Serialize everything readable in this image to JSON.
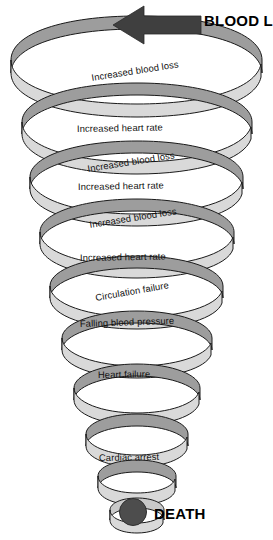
{
  "diagram": {
    "type": "descending-spiral-flow",
    "colors": {
      "background": "#ffffff",
      "ribbon_front": "#d9d9d9",
      "ribbon_back": "#9d9d9d",
      "ribbon_outline": "#1a1a1a",
      "arrow": "#3f3f3f",
      "death_marker": "#4d4d4d",
      "label_text": "#111111"
    },
    "entry": {
      "label": "BLOOD LOSS",
      "icon": "left-arrow-icon",
      "arrow_direction": "left"
    },
    "exit": {
      "label": "DEATH",
      "marker": "filled-circle-marker"
    },
    "coils": [
      {
        "id": 1,
        "label": "Increased blood loss",
        "shaded": true
      },
      {
        "id": 2,
        "label": "Increased heart rate",
        "shaded": false
      },
      {
        "id": 3,
        "label": "Increased blood loss",
        "shaded": true
      },
      {
        "id": 4,
        "label": "Increased heart rate",
        "shaded": false
      },
      {
        "id": 5,
        "label": "Increased blood loss",
        "shaded": true
      },
      {
        "id": 6,
        "label": "Increased heart rate",
        "shaded": false
      },
      {
        "id": 7,
        "label": "Circulation failure",
        "shaded": true
      },
      {
        "id": 8,
        "label": "Falling blood pressure",
        "shaded": false
      },
      {
        "id": 9,
        "label": "Heart failure",
        "shaded": false
      },
      {
        "id": 10,
        "label": "Cardiac arrest",
        "shaded": false
      }
    ]
  }
}
